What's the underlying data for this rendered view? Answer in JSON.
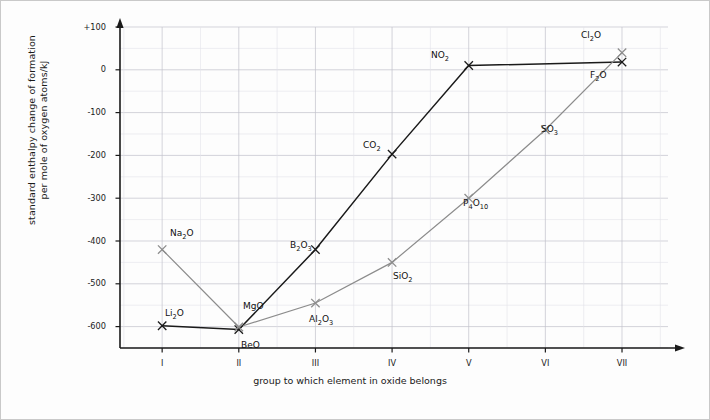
{
  "chart_data": {
    "type": "line",
    "title": "",
    "xlabel": "group to which element in oxide belongs",
    "ylabel": "standard enthalpy change of formation per mole of oxygen atoms/kJ",
    "ylabel_line1": "standard enthalpy change of formation",
    "ylabel_line2": "per mole of oxygen atoms/kJ",
    "categories": [
      "I",
      "II",
      "III",
      "IV",
      "V",
      "VI",
      "VII"
    ],
    "x": [
      1,
      2,
      3,
      4,
      5,
      6,
      7
    ],
    "ylim": [
      -650,
      100
    ],
    "xlim": [
      0.45,
      7.6
    ],
    "yticks": [
      100,
      0,
      -100,
      -200,
      -300,
      -400,
      -500,
      -600
    ],
    "ytick_labels": [
      "+100",
      "0",
      "-100",
      "-200",
      "-300",
      "-400",
      "-500",
      "-600"
    ],
    "grid": true,
    "grid_minor_step": 50,
    "legend": "none",
    "series": [
      {
        "name": "period-2-oxides",
        "color": "#1a1a1a",
        "points": [
          {
            "label": "Li2O",
            "label_html": "Li<sub>2</sub>O",
            "group": "I",
            "x": 1,
            "y": -598
          },
          {
            "label": "BeO",
            "label_html": "BeO",
            "group": "II",
            "x": 2,
            "y": -607
          },
          {
            "label": "B2O3",
            "label_html": "B<sub>2</sub>O<sub>3</sub>",
            "group": "III",
            "x": 3,
            "y": -420
          },
          {
            "label": "CO2",
            "label_html": "CO<sub>2</sub>",
            "group": "IV",
            "x": 4,
            "y": -197
          },
          {
            "label": "NO2",
            "label_html": "NO<sub>2</sub>",
            "group": "V",
            "x": 5,
            "y": 10
          },
          {
            "label": "F2O",
            "label_html": "F<sub>2</sub>O",
            "group": "VII",
            "x": 7,
            "y": 18
          }
        ]
      },
      {
        "name": "period-3-and-other-oxides",
        "color": "#8c8c8c",
        "points": [
          {
            "label": "Na2O",
            "label_html": "Na<sub>2</sub>O",
            "group": "I",
            "x": 1,
            "y": -420
          },
          {
            "label": "MgO",
            "label_html": "MgO",
            "group": "II",
            "x": 2,
            "y": -601
          },
          {
            "label": "Al2O3",
            "label_html": "Al<sub>2</sub>O<sub>3</sub>",
            "group": "III",
            "x": 3,
            "y": -545
          },
          {
            "label": "SiO2",
            "label_html": "SiO<sub>2</sub>",
            "group": "IV",
            "x": 4,
            "y": -450
          },
          {
            "label": "P4O10",
            "label_html": "P<sub>4</sub>O<sub>10</sub>",
            "group": "V",
            "x": 5,
            "y": -300
          },
          {
            "label": "SO3",
            "label_html": "SO<sub>3</sub>",
            "group": "VI",
            "x": 6,
            "y": -140
          },
          {
            "label": "Cl2O",
            "label_html": "Cl<sub>2</sub>O",
            "group": "VII",
            "x": 7,
            "y": 40
          }
        ]
      }
    ],
    "point_labels": [
      {
        "text": "Li2O",
        "html": "Li<sub>2</sub>O",
        "px": 165,
        "py": 308
      },
      {
        "text": "Na2O",
        "html": "Na<sub>2</sub>O",
        "px": 170,
        "py": 228
      },
      {
        "text": "BeO",
        "html": "BeO",
        "px": 241,
        "py": 340
      },
      {
        "text": "MgO",
        "html": "MgO",
        "px": 243,
        "py": 301
      },
      {
        "text": "B2O3",
        "html": "B<sub>2</sub>O<sub>3</sub>",
        "px": 290,
        "py": 240
      },
      {
        "text": "Al2O3",
        "html": "Al<sub>2</sub>O<sub>3</sub>",
        "px": 309,
        "py": 314
      },
      {
        "text": "CO2",
        "html": "CO<sub>2</sub>",
        "px": 363,
        "py": 140
      },
      {
        "text": "SiO2",
        "html": "SiO<sub>2</sub>",
        "px": 393,
        "py": 271
      },
      {
        "text": "NO2",
        "html": "NO<sub>2</sub>",
        "px": 431,
        "py": 50
      },
      {
        "text": "P4O10",
        "html": "P<sub>4</sub>O<sub>10</sub>",
        "px": 463,
        "py": 198
      },
      {
        "text": "SO3",
        "html": "SO<sub>3</sub>",
        "px": 541,
        "py": 124
      },
      {
        "text": "Cl2O",
        "html": "Cl<sub>2</sub>O",
        "px": 581,
        "py": 30
      },
      {
        "text": "F2O",
        "html": "F<sub>2</sub>O",
        "px": 590,
        "py": 70
      }
    ],
    "colors": {
      "line_dark": "#1a1a1a",
      "line_gray": "#8c8c8c",
      "axis": "#1a1a1a",
      "grid_major": "#c2c2cc",
      "grid_minor": "#e2e2ea",
      "background": "#fdfdfd",
      "border": "#c9c9c9"
    }
  },
  "axes": {
    "y_tick_labels": [
      "+100",
      "0",
      "-100",
      "-200",
      "-300",
      "-400",
      "-500",
      "-600"
    ],
    "x_tick_labels": [
      "I",
      "II",
      "III",
      "IV",
      "V",
      "VI",
      "VII"
    ],
    "x_axis_title": "group to which element in oxide belongs",
    "y_axis_title_line1": "standard enthalpy change of formation",
    "y_axis_title_line2": "per mole of oxygen atoms/kJ"
  }
}
